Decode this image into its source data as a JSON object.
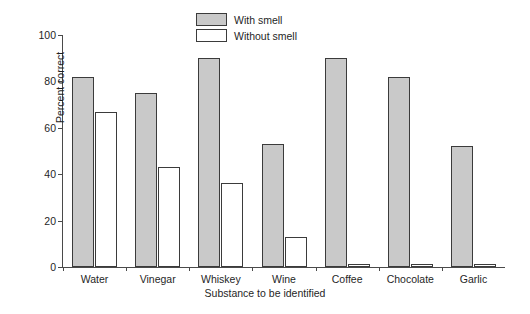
{
  "chart_data": {
    "type": "bar",
    "title": "",
    "xlabel": "Substance to be identified",
    "ylabel": "Percent correct",
    "categories": [
      "Water",
      "Vinegar",
      "Whiskey",
      "Wine",
      "Coffee",
      "Chocolate",
      "Garlic"
    ],
    "series": [
      {
        "name": "With smell",
        "values": [
          82,
          75,
          90,
          53,
          90,
          82,
          52
        ]
      },
      {
        "name": "Without smell",
        "values": [
          67,
          43,
          36,
          13,
          1.5,
          1.5,
          1.5
        ]
      }
    ],
    "ylim": [
      0,
      100
    ],
    "yticks": [
      0,
      20,
      40,
      60,
      80,
      100
    ],
    "ytick_labels": [
      "0",
      "20",
      "40",
      "60",
      "80",
      "100"
    ],
    "grid": false,
    "legend_position": "top-center",
    "colors": {
      "with_smell_fill": "#c9c9c9",
      "without_smell_fill": "#ffffff",
      "bar_edge": "#3b3b3b",
      "axis": "#4a4a4a",
      "text": "#1f1f1f",
      "background": "#ffffff"
    }
  },
  "legend": {
    "items": [
      {
        "label": "With smell",
        "swatch": "filled"
      },
      {
        "label": "Without smell",
        "swatch": "empty"
      }
    ]
  }
}
